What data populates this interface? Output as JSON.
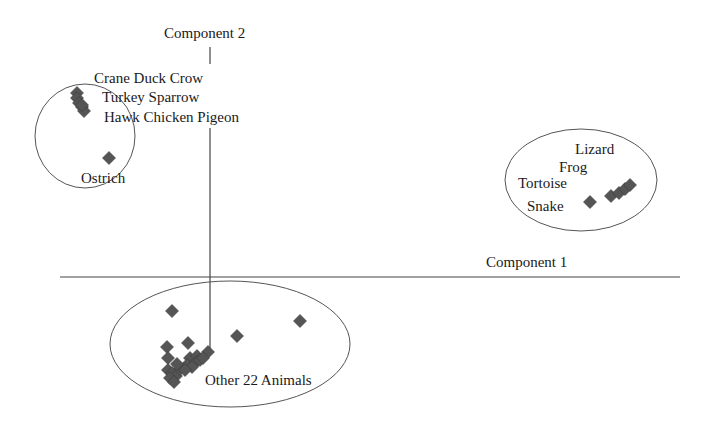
{
  "chart_data": {
    "type": "scatter",
    "title": "",
    "xlabel": "Component 1",
    "ylabel": "Component 2",
    "grid": false,
    "legend": "none",
    "marker": "diamond",
    "marker_color": "#555555",
    "clusters": [
      {
        "name": "Birds",
        "labels": [
          "Crane Duck Crow",
          "Turkey Sparrow",
          "Hawk Chicken Pigeon",
          "Ostrich"
        ],
        "ellipse": {
          "cx": 85,
          "cy": 136,
          "rx": 50,
          "ry": 52
        },
        "points": [
          [
            77,
            93
          ],
          [
            77,
            98
          ],
          [
            79,
            103
          ],
          [
            82,
            107
          ],
          [
            84,
            111
          ],
          [
            82,
            105
          ],
          [
            109,
            158
          ]
        ]
      },
      {
        "name": "Reptiles/Amphibians",
        "labels": [
          "Lizard",
          "Frog",
          "Tortoise",
          "Snake"
        ],
        "ellipse": {
          "cx": 581,
          "cy": 180,
          "rx": 76,
          "ry": 51
        },
        "points": [
          [
            590,
            202
          ],
          [
            611,
            196
          ],
          [
            619,
            193
          ],
          [
            625,
            189
          ],
          [
            630,
            185
          ]
        ]
      },
      {
        "name": "Other 22 Animals",
        "labels": [
          "Other 22 Animals"
        ],
        "ellipse": {
          "cx": 230,
          "cy": 344,
          "rx": 120,
          "ry": 63
        },
        "points": [
          [
            172,
            311
          ],
          [
            300,
            321
          ],
          [
            237,
            336
          ],
          [
            188,
            343
          ],
          [
            167,
            347
          ],
          [
            168,
            358
          ],
          [
            190,
            358
          ],
          [
            197,
            356
          ],
          [
            208,
            352
          ],
          [
            187,
            365
          ],
          [
            196,
            362
          ],
          [
            200,
            360
          ],
          [
            168,
            370
          ],
          [
            172,
            373
          ],
          [
            176,
            376
          ],
          [
            170,
            378
          ],
          [
            174,
            382
          ],
          [
            180,
            369
          ],
          [
            192,
            367
          ],
          [
            203,
            358
          ],
          [
            185,
            370
          ],
          [
            177,
            364
          ]
        ]
      }
    ],
    "axes": {
      "x_axis": {
        "y": 277,
        "x_from": 60,
        "x_to": 680
      },
      "y_axis": {
        "x": 210,
        "y_from": 47,
        "y_to": 355
      }
    }
  },
  "labels": {
    "component2": "Component 2",
    "component1": "Component 1",
    "bird_line1": "Crane Duck Crow",
    "bird_line2": "Turkey Sparrow",
    "bird_line3": "Hawk Chicken Pigeon",
    "ostrich": "Ostrich",
    "lizard": "Lizard",
    "frog": "Frog",
    "tortoise": "Tortoise",
    "snake": "Snake",
    "other": "Other 22 Animals"
  }
}
